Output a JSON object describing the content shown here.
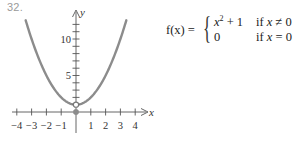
{
  "problem": {
    "number": "32."
  },
  "formula": {
    "lhs": "f(x) =",
    "cases": [
      {
        "expr_base": "x",
        "expr_exp": "2",
        "expr_tail": " + 1",
        "condition": "if x ≠ 0"
      },
      {
        "expr_base": "0",
        "expr_exp": "",
        "expr_tail": "",
        "condition": "if x = 0"
      }
    ]
  },
  "chart_data": {
    "type": "line",
    "title": "",
    "xlabel": "x",
    "ylabel": "y",
    "xlim": [
      -4.3,
      4.7
    ],
    "ylim": [
      0,
      13.5
    ],
    "x_ticks": [
      -4,
      -3,
      -2,
      -1,
      1,
      2,
      3,
      4
    ],
    "x_tick_labels": [
      "−4",
      "−3",
      "−2",
      "−1",
      "1",
      "2",
      "3",
      "4"
    ],
    "y_ticks": [
      1,
      2,
      3,
      4,
      5,
      6,
      7,
      8,
      9,
      10,
      11,
      12
    ],
    "y_tick_labels": [
      {
        "value": 5,
        "label": "5"
      },
      {
        "value": 10,
        "label": "10"
      }
    ],
    "grid": false,
    "series": [
      {
        "name": "y = x^2 + 1 (x ≠ 0)",
        "x": [
          -3.4,
          -3,
          -2.5,
          -2,
          -1.5,
          -1,
          -0.5,
          0,
          0.5,
          1,
          1.5,
          2,
          2.5,
          3,
          3.4
        ],
        "y": [
          12.56,
          10,
          7.25,
          5,
          3.25,
          2,
          1.25,
          1,
          1.25,
          2,
          3.25,
          5,
          7.25,
          10,
          12.56
        ],
        "color": "#8c8c8c"
      }
    ],
    "points": [
      {
        "x": 0,
        "y": 1,
        "style": "open"
      },
      {
        "x": 0,
        "y": 0,
        "style": "filled"
      }
    ]
  }
}
